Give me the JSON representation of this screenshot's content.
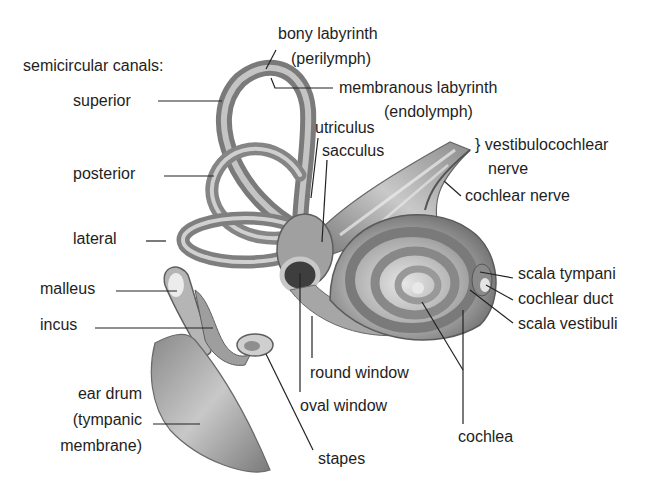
{
  "diagram": {
    "heading": "semicircular canals:",
    "labels": {
      "superior": "superior",
      "posterior": "posterior",
      "lateral": "lateral",
      "malleus": "malleus",
      "incus": "incus",
      "ear_drum_1": "ear drum",
      "ear_drum_2": "(tympanic",
      "ear_drum_3": "membrane)",
      "bony_1": "bony labyrinth",
      "bony_2": "(perilymph)",
      "membranous_1": "membranous labyrinth",
      "membranous_2": "(endolymph)",
      "utriculus": "utriculus",
      "sacculus": "sacculus",
      "vestibulocochlear_1": "} vestibulocochlear",
      "vestibulocochlear_2": "nerve",
      "cochlear_nerve": "cochlear nerve",
      "scala_tympani": "scala tympani",
      "cochlear_duct": "cochlear duct",
      "scala_vestibuli": "scala vestibuli",
      "round_window": "round window",
      "oval_window": "oval window",
      "stapes": "stapes",
      "cochlea": "cochlea"
    },
    "colors": {
      "background": "#ffffff",
      "text": "#1e1e1e",
      "leader": "#222222",
      "tissue_dark": "#6a6a6a",
      "tissue_mid": "#9a9a9a",
      "tissue_light": "#d4d4d4"
    }
  }
}
